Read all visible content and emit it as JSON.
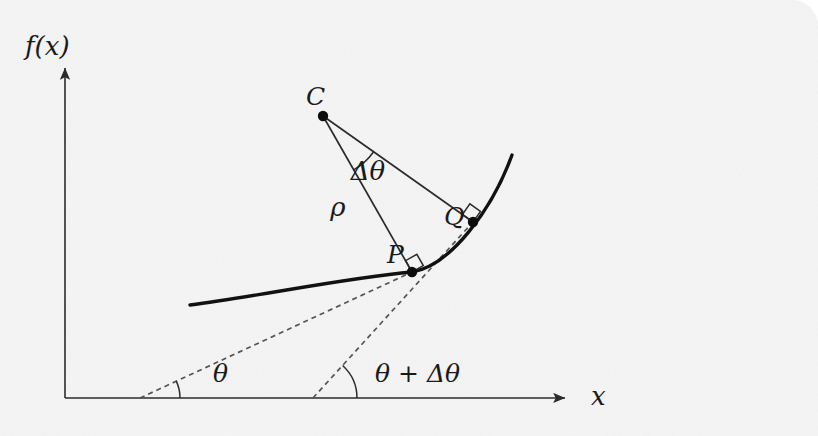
{
  "figure": {
    "kind": "geometry-diagram",
    "caption_text": "",
    "background_color": "#ebebeb",
    "page_color": "#ffffff",
    "stroke_color": "#2b2b2b",
    "curve_color": "#111111",
    "dashed_color": "#555555",
    "corner_radius_px": 26
  },
  "axes": {
    "y_axis_label": "f(x)",
    "x_axis_label": "x",
    "origin": {
      "x": 65,
      "y": 398
    },
    "x_axis_end": {
      "x": 565,
      "y": 398
    },
    "y_axis_top": {
      "x": 65,
      "y": 68
    }
  },
  "points": [
    {
      "id": "C",
      "label": "C",
      "x": 323,
      "y": 116,
      "label_x": 306,
      "label_y": 105,
      "dot": true
    },
    {
      "id": "P",
      "label": "P",
      "x": 412,
      "y": 272,
      "label_x": 387,
      "label_y": 263,
      "dot": true
    },
    {
      "id": "Q",
      "label": "Q",
      "x": 473,
      "y": 222,
      "label_x": 444,
      "label_y": 225,
      "dot": true
    }
  ],
  "segment_labels": [
    {
      "id": "rho",
      "label": "ρ",
      "x": 338,
      "y": 216
    },
    {
      "id": "delta-theta",
      "label": "Δθ",
      "x": 368,
      "y": 180
    }
  ],
  "angle_labels": [
    {
      "id": "theta",
      "label": "θ",
      "x": 213,
      "y": 382,
      "vertex_x": 140,
      "vertex_y": 398,
      "arc_radius": 40
    },
    {
      "id": "theta-plus-delta-theta",
      "label": "θ + Δθ",
      "x": 375,
      "y": 382,
      "vertex_x": 313,
      "vertex_y": 398,
      "arc_radius": 44
    }
  ],
  "right_angle_marks": [
    {
      "id": "right-angle-at-P",
      "x": 412,
      "y": 272
    },
    {
      "id": "right-angle-at-Q",
      "x": 473,
      "y": 222
    }
  ],
  "curve": {
    "id": "function-curve",
    "description": "concave-up curve f(x) passing through P and Q",
    "path": "M 190 305 C 260 296, 345 278, 412 272 C 450 266, 492 210, 512 155"
  },
  "dashed_lines": [
    {
      "id": "tangent-at-P",
      "from_x": 140,
      "from_y": 398,
      "to_x": 412,
      "to_y": 272
    },
    {
      "id": "tangent-at-Q",
      "from_x": 313,
      "from_y": 398,
      "to_x": 473,
      "to_y": 222
    }
  ],
  "radii": [
    {
      "id": "radius-C-to-P",
      "from_x": 323,
      "from_y": 116,
      "to_x": 412,
      "to_y": 272
    },
    {
      "id": "radius-C-to-Q",
      "from_x": 323,
      "from_y": 116,
      "to_x": 473,
      "to_y": 222
    }
  ]
}
